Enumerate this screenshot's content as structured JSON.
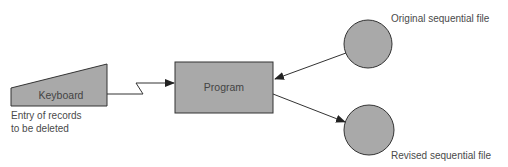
{
  "diagram": {
    "type": "flowchart",
    "colors": {
      "shape_fill": "#a9a9a9",
      "stroke": "#333333",
      "text": "#4a4a4a",
      "background": "#ffffff"
    },
    "nodes": {
      "keyboard": {
        "label": "Keyboard",
        "shape": "manual-input"
      },
      "program": {
        "label": "Program",
        "shape": "rectangle"
      },
      "original_file": {
        "label": "Original sequential file",
        "shape": "circle"
      },
      "revised_file": {
        "label": "Revised sequential file",
        "shape": "circle"
      }
    },
    "annotations": {
      "keyboard_caption_line1": "Entry of records",
      "keyboard_caption_line2": "to be deleted"
    },
    "edges": [
      {
        "from": "keyboard",
        "to": "program",
        "style": "lightning"
      },
      {
        "from": "original_file",
        "to": "program",
        "style": "arrow"
      },
      {
        "from": "program",
        "to": "revised_file",
        "style": "arrow"
      }
    ]
  }
}
